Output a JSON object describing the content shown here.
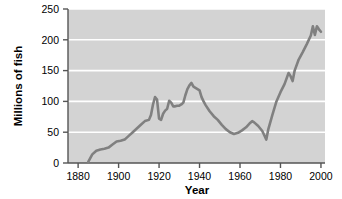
{
  "chart_data": {
    "type": "line",
    "title": "",
    "xlabel": "Year",
    "ylabel": "Millions of fish",
    "xlim": [
      1875,
      2002
    ],
    "ylim": [
      0,
      250
    ],
    "xticks": [
      1880,
      1900,
      1920,
      1940,
      1960,
      1980,
      2000
    ],
    "xtick_labels": [
      "1880",
      "1900",
      "1920",
      "1940",
      "1960",
      "1980",
      "2000"
    ],
    "yticks": [
      0,
      50,
      100,
      150,
      200,
      250
    ],
    "ytick_labels": [
      "0",
      "50",
      "100",
      "150",
      "200",
      "250"
    ],
    "grid": "horizontal-white-gridlines",
    "legend": "none",
    "plot_background": "#d3d3d3",
    "line_color": "#808080",
    "line_width": 2.6,
    "axis_color": "#555555",
    "series": [
      {
        "name": "Fish catch",
        "x": [
          1885,
          1887,
          1889,
          1891,
          1893,
          1895,
          1897,
          1899,
          1901,
          1903,
          1905,
          1907,
          1909,
          1911,
          1913,
          1915,
          1916,
          1917,
          1918,
          1919,
          1920,
          1921,
          1922,
          1923,
          1924,
          1925,
          1926,
          1927,
          1928,
          1929,
          1930,
          1931,
          1932,
          1933,
          1934,
          1935,
          1936,
          1937,
          1938,
          1939,
          1940,
          1941,
          1942,
          1943,
          1945,
          1947,
          1949,
          1951,
          1953,
          1955,
          1957,
          1959,
          1961,
          1963,
          1965,
          1966,
          1967,
          1969,
          1971,
          1972,
          1973,
          1974,
          1976,
          1978,
          1980,
          1982,
          1984,
          1985,
          1986,
          1987,
          1989,
          1991,
          1993,
          1995,
          1996,
          1997,
          1998,
          1999,
          2000
        ],
        "y": [
          2,
          14,
          20,
          22,
          23,
          25,
          30,
          35,
          36,
          38,
          44,
          50,
          56,
          62,
          68,
          70,
          78,
          95,
          107,
          103,
          72,
          70,
          80,
          85,
          88,
          101,
          98,
          92,
          92,
          93,
          93,
          95,
          98,
          110,
          120,
          126,
          130,
          124,
          122,
          120,
          118,
          107,
          100,
          94,
          84,
          76,
          70,
          62,
          55,
          50,
          47,
          49,
          53,
          58,
          65,
          68,
          66,
          60,
          52,
          45,
          38,
          55,
          78,
          100,
          115,
          128,
          146,
          141,
          133,
          150,
          168,
          180,
          193,
          207,
          222,
          208,
          222,
          217,
          213
        ]
      }
    ]
  }
}
